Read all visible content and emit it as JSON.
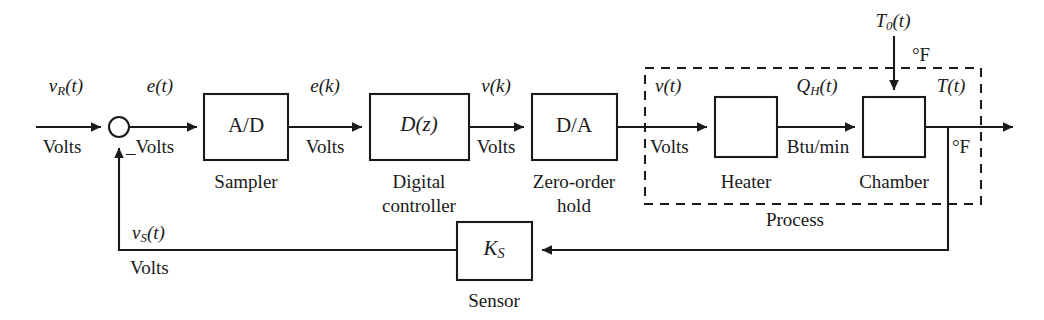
{
  "diagram": {
    "type": "control-system-block-diagram",
    "stroke_color": "#1a1a1a",
    "background_color": "#ffffff"
  },
  "signals": {
    "reference": {
      "name": "vR(t)",
      "base": "v",
      "sub": "R",
      "suffix": "(t)",
      "unit": "Volts"
    },
    "error_continuous": {
      "name": "e(t)",
      "base": "e",
      "sub": "",
      "suffix": "(t)",
      "unit": "_Volts"
    },
    "error_sampled": {
      "name": "e(k)",
      "base": "e",
      "sub": "",
      "suffix": "(k)",
      "unit": "Volts"
    },
    "control_discrete": {
      "name": "v(k)",
      "base": "v",
      "sub": "",
      "suffix": "(k)",
      "unit": "Volts"
    },
    "control_continuous": {
      "name": "v(t)",
      "base": "v",
      "sub": "",
      "suffix": "(t)",
      "unit": "Volts"
    },
    "heat_flow": {
      "name": "QH(t)",
      "base": "Q",
      "sub": "H",
      "suffix": "(t)",
      "unit": "Btu/min"
    },
    "temperature": {
      "name": "T(t)",
      "base": "T",
      "sub": "",
      "suffix": "(t)",
      "unit": "°F"
    },
    "disturbance": {
      "name": "T0(t)",
      "base": "T",
      "sub": "0",
      "suffix": "(t)",
      "unit": "°F"
    },
    "sensor_feedback": {
      "name": "vS(t)",
      "base": "v",
      "sub": "S",
      "suffix": "(t)",
      "unit": "Volts"
    }
  },
  "blocks": [
    {
      "id": "ad",
      "label": "A/D",
      "caption": "Sampler",
      "italic": false
    },
    {
      "id": "dz",
      "label": "D(z)",
      "caption": "Digital\ncontroller",
      "caption_line1": "Digital",
      "caption_line2": "controller",
      "italic": true
    },
    {
      "id": "da",
      "label": "D/A",
      "caption": "Zero-order\nhold",
      "caption_line1": "Zero-order",
      "caption_line2": "hold",
      "italic": false
    },
    {
      "id": "heater",
      "label": "",
      "caption": "Heater",
      "italic": false
    },
    {
      "id": "chamber",
      "label": "",
      "caption": "Chamber",
      "italic": false
    },
    {
      "id": "sensor",
      "label": "KS",
      "label_base": "K",
      "label_sub": "S",
      "caption": "Sensor",
      "italic": true
    }
  ],
  "groups": [
    {
      "id": "process",
      "label": "Process",
      "style": "dashed"
    }
  ],
  "junctions": [
    {
      "id": "summing-junction",
      "shape": "circle",
      "sign_label": "_"
    }
  ]
}
